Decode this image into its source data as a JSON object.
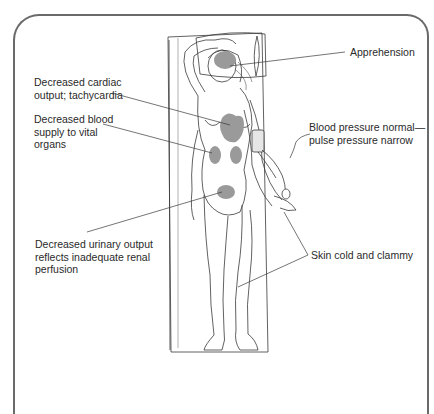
{
  "figure": {
    "shade_color": "#9a9a9a",
    "line_color": "#3a3a3a",
    "frame_color": "#6a6a6a"
  },
  "labels": {
    "apprehension": "Apprehension",
    "cardiac": "Decreased cardiac\noutput; tachycardia",
    "blood_supply": "Decreased blood\nsupply to vital\norgans",
    "blood_pressure": "Blood pressure normal—\npulse pressure narrow",
    "urinary": "Decreased urinary output\nreflects inadequate renal\nperfusion",
    "skin": "Skin cold and clammy"
  }
}
